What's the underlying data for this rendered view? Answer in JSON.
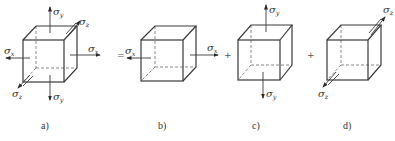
{
  "figure": {
    "panels": [
      {
        "id": "a",
        "label": "a)",
        "stresses": [
          "σx",
          "σy",
          "σz"
        ]
      },
      {
        "id": "b",
        "label": "b)",
        "stresses": [
          "σx"
        ]
      },
      {
        "id": "c",
        "label": "c)",
        "stresses": [
          "σy"
        ]
      },
      {
        "id": "d",
        "label": "d)",
        "stresses": [
          "σz"
        ]
      }
    ],
    "operators": [
      "=",
      "+",
      "+"
    ],
    "symbols": {
      "sigma": "σ",
      "x": "x",
      "y": "y",
      "z": "z"
    }
  }
}
